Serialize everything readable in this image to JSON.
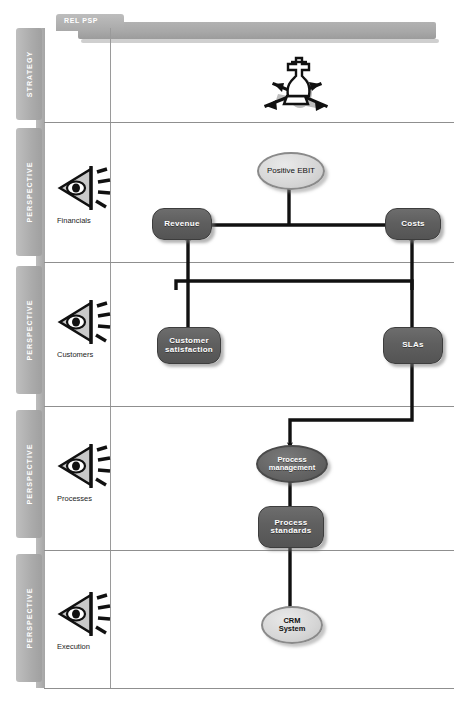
{
  "banner": {
    "left_tab_label": "REL PSP",
    "right_label": "CAUSE & EFFECT"
  },
  "vertical_tabs": [
    {
      "label": "STRATEGY"
    },
    {
      "label": "PERSPECTIVE"
    },
    {
      "label": "PERSPECTIVE"
    },
    {
      "label": "PERSPECTIVE"
    },
    {
      "label": "PERSPECTIVE"
    }
  ],
  "rows": [
    {
      "key": "strategy",
      "label": "",
      "icon": "chess-strategy-icon"
    },
    {
      "key": "financials",
      "label": "Financials",
      "icon": "projector-eye-icon"
    },
    {
      "key": "customers",
      "label": "Customers",
      "icon": "projector-eye-icon"
    },
    {
      "key": "processes",
      "label": "Processes",
      "icon": "projector-eye-icon"
    },
    {
      "key": "execution",
      "label": "Execution",
      "icon": "projector-eye-icon"
    }
  ],
  "nodes": {
    "positive_ebit": "Positive EBIT",
    "revenue": "Revenue",
    "costs": "Costs",
    "customer_satisfaction_line1": "Customer",
    "customer_satisfaction_line2": "satisfaction",
    "slas": "SLAs",
    "process_management_line1": "Process",
    "process_management_line2": "management",
    "process_standards_line1": "Process",
    "process_standards_line2": "standards",
    "crm_system_line1": "CRM",
    "crm_system_line2": "System"
  },
  "caption": "",
  "colors": {
    "node_dark": "#5f5f5f",
    "node_light": "#d6d6d6",
    "banner": "#a8a8a8",
    "tab": "#ababab",
    "link": "#111111"
  }
}
